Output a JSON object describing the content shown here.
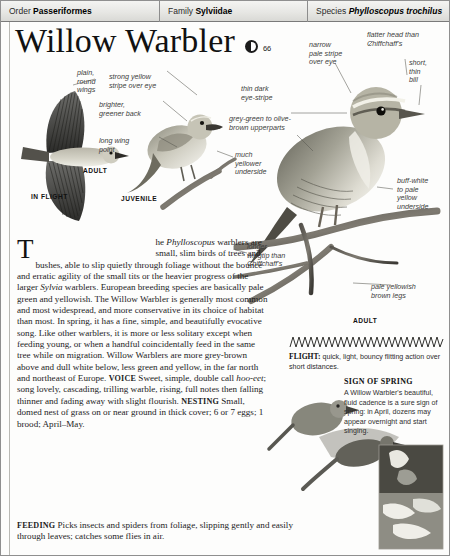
{
  "header": {
    "order_label": "Order",
    "order_value": "Passeriformes",
    "family_label": "Family",
    "family_value": "Sylviidae",
    "species_label": "Species",
    "species_value": "Phylloscopus trochilus"
  },
  "title": {
    "name": "Willow Warbler",
    "audio_icon": "speaker-icon",
    "audio_track": "66"
  },
  "callouts": {
    "plain_round_wings": "plain,\nround\nwings",
    "strong_yellow_stripe": "strong yellow\nstripe over eye",
    "brighter_greener_back": "brighter,\ngreener back",
    "long_wing_point": "long wing\npoint",
    "much_yellower_underside": "much\nyellower\nunderside",
    "narrow_pale_stripe": "narrow\npale stripe\nover eye",
    "flatter_head": "flatter head than\nChiffchaff's",
    "short_thin_bill": "short,\nthin\nbill",
    "thin_dark_eyestripe": "thin dark\neye-stripe",
    "grey_green_upperparts": "grey-green to olive-\nbrown upperparts",
    "buff_white_underside": "buff-white\nto pale\nyellow\nunderside",
    "longer_wingtip": "longer\nwingtip than\nChiffchaff's",
    "pale_yellowish_legs": "pale yellowish\nbrown legs"
  },
  "plate_labels": {
    "adult_wing": "ADULT",
    "in_flight": "IN FLIGHT",
    "juvenile": "JUVENILE",
    "adult_perched": "ADULT"
  },
  "body": {
    "dropcap": "T",
    "intro_lead": "he ",
    "intro_genus": "Phylloscopus",
    "paragraph_1": " warblers are small, slim birds of trees and bushes, able to slip quietly through foliage without the bounce and erratic agility of the small tits or the heavier progress of the larger ",
    "genus_2": "Sylvia",
    "paragraph_2": " warblers. European breeding species are basically pale green and yellowish. The Willow Warbler is generally most common and most widespread, and more conservative in its choice of habitat than most. In spring, it has a fine, simple, and beautifully evocative song. Like other warblers, it is more or less solitary except when feeding young, or when a handful coincidentally feed in the same tree while on migration. Willow Warblers are more grey-brown above and dull white below, less green and yellow, in the far north and northeast of Europe.",
    "voice_head": "VOICE",
    "voice_text_a": " Sweet, simple, double call ",
    "voice_call": "hoo-eet",
    "voice_text_b": "; song lovely, cascading, trilling warble, rising, full notes then falling thinner and fading away with slight flourish.",
    "nesting_head": "NESTING",
    "nesting_text": " Small, domed nest of grass on or near ground in thick cover; 6 or 7 eggs; 1 brood; April–May.",
    "feeding_head": "FEEDING",
    "feeding_text": " Picks insects and spiders from foliage, slipping gently and easily through leaves; catches some flies in air."
  },
  "flight": {
    "head": "FLIGHT:",
    "text": " quick, light, bouncy flitting action over short distances."
  },
  "spring": {
    "title": "SIGN OF SPRING",
    "text": "A Willow Warbler's beautiful, fluid cadence is a sure sign of spring: in April, dozens may appear overnight and start singing."
  },
  "colors": {
    "header_bg": "#e7e7e4",
    "rule": "#8d8d8d",
    "callout_text": "#3d3d3d",
    "body_text": "#1c1c1c"
  }
}
